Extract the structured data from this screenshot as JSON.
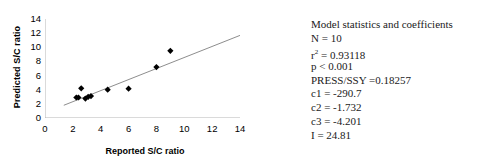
{
  "chart_data": {
    "type": "scatter",
    "title": "",
    "xlabel": "Reported S/C ratio",
    "ylabel": "Predicted S/C ratio",
    "xlim": [
      0,
      14
    ],
    "ylim": [
      0,
      14
    ],
    "xticks": [
      0,
      2,
      4,
      6,
      8,
      10,
      12,
      14
    ],
    "yticks": [
      0,
      2,
      4,
      6,
      8,
      10,
      12,
      14
    ],
    "grid": false,
    "legend": "none",
    "marker": "filled-diamond",
    "marker_color": "#000000",
    "points": [
      {
        "x": 2.25,
        "y": 2.9
      },
      {
        "x": 2.4,
        "y": 2.9
      },
      {
        "x": 2.6,
        "y": 4.2
      },
      {
        "x": 2.9,
        "y": 2.75
      },
      {
        "x": 3.1,
        "y": 3.0
      },
      {
        "x": 3.3,
        "y": 3.1
      },
      {
        "x": 4.5,
        "y": 4.0
      },
      {
        "x": 6.0,
        "y": 4.15
      },
      {
        "x": 8.0,
        "y": 7.2
      },
      {
        "x": 9.0,
        "y": 9.5
      }
    ],
    "trendline": {
      "type": "linear",
      "color": "#808080",
      "x_start": 1.35,
      "y_start": 1.8,
      "x_end": 14.6,
      "y_end": 12.15
    }
  },
  "stats": {
    "heading": "Model statistics and coefficients",
    "lines": [
      {
        "text": "N = 10"
      },
      {
        "text": "= 0.93118",
        "prefix": "r",
        "superscript": "2"
      },
      {
        "text": "p < 0.001"
      },
      {
        "text": "PRESS/SSY =0.18257"
      },
      {
        "text": "c1 = -290.7"
      },
      {
        "text": "c2 = -1.732"
      },
      {
        "text": "c3 = -4.201"
      },
      {
        "text": "I = 24.81"
      }
    ]
  }
}
